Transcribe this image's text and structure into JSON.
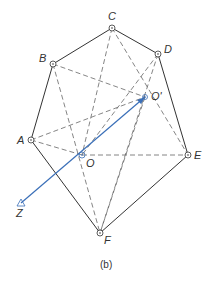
{
  "diagram": {
    "caption": "(b)",
    "colors": {
      "solid": "#333333",
      "dashed": "#666666",
      "axis": "#3a6fb8",
      "background": "#ffffff"
    },
    "points": {
      "C": {
        "label": "C",
        "x": 112,
        "y": 28
      },
      "B": {
        "label": "B",
        "x": 53,
        "y": 64
      },
      "D": {
        "label": "D",
        "x": 158,
        "y": 54
      },
      "O_prime": {
        "label": "O'",
        "x": 145,
        "y": 97
      },
      "A": {
        "label": "A",
        "x": 31,
        "y": 140
      },
      "O": {
        "label": "O",
        "x": 82,
        "y": 155
      },
      "E": {
        "label": "E",
        "x": 188,
        "y": 155
      },
      "F": {
        "label": "F",
        "x": 100,
        "y": 233
      },
      "Z": {
        "label": "Z",
        "x": 21,
        "y": 203
      }
    },
    "polygon_edges": [
      "A-B",
      "B-C",
      "C-D",
      "D-E",
      "E-F",
      "F-A"
    ],
    "dashed_edges": [
      "B-O'",
      "A-O'",
      "A-O",
      "O-E",
      "C-O",
      "C-E",
      "D-O",
      "D-F",
      "B-F",
      "O-F",
      "C-F"
    ],
    "axis": {
      "from": "O'",
      "to": "Z",
      "label": "Z"
    }
  }
}
